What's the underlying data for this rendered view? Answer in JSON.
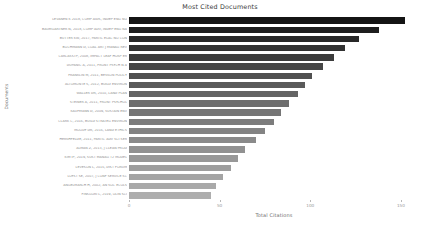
{
  "chart_data": {
    "type": "bar",
    "orientation": "horizontal",
    "title": "Most Cited Documents",
    "xlabel": "Total Citations",
    "ylabel": "Documents",
    "xlim": [
      0,
      160
    ],
    "grid": false,
    "legend": null,
    "xticks": [
      0,
      50,
      100,
      150
    ],
    "xtick_labels": [
      "0",
      "50",
      "100",
      "150"
    ],
    "categories": [
      "LEVANEN K 2018, COMP AIDS, INDEP ENG NO",
      "BAUMGARTNER N, 2018, COMP ADV, INDEP ENG NA",
      "BUTTER KW, 2017, PARTIC ELAC NO CON",
      "BOCHMANN D, COAL ART J MANAG REV",
      "CARCASSTP, 2008, IMPACT LEAF HOSP ER",
      "DUPANIC A, 2011, FRONT PSYCH N A",
      "FRANKLIN M, 2011, BESSON POLICY",
      "ALTOMONTE S, 2012, BUILD ENVIRON",
      "WALLER DR, 2010, LAND PLAN",
      "STEINER A, 2011, FRONT PSYCHOL",
      "KAUFMANN D, 2009, SUSTAIN ENV",
      "CLARK C, 2016, BUILD STRATEG ENVIRON",
      "MOODY DR, 2016, LAND ETHICS",
      "HERSHFELDE, 2011, PARTIC ADV SCI SER",
      "ALMAN Z, 2013, J CLEAN PROD",
      "KIM IP, 2019, SUST MANAG T2 MODEL",
      "LEVESON L, 2016, DIST FORUM",
      "LOYST SE, 2007, J CONF SERVICE SC",
      "ANGELMARCH H, 2002, AN SOC ECOLS",
      "FINSGORI L, 2019, OLIN SCI"
    ],
    "values": [
      152,
      138,
      127,
      119,
      113,
      107,
      101,
      97,
      93,
      88,
      84,
      80,
      75,
      70,
      64,
      60,
      56,
      52,
      48,
      45
    ],
    "bar_colors": [
      "#141414",
      "#1e1e1e",
      "#282828",
      "#323232",
      "#3c3c3c",
      "#464646",
      "#505050",
      "#5a5a5a",
      "#646464",
      "#6e6e6e",
      "#757575",
      "#7c7c7c",
      "#838383",
      "#8a8a8a",
      "#919191",
      "#989898",
      "#9e9e9e",
      "#a4a4a4",
      "#a9a9a9",
      "#aeaeae"
    ]
  }
}
